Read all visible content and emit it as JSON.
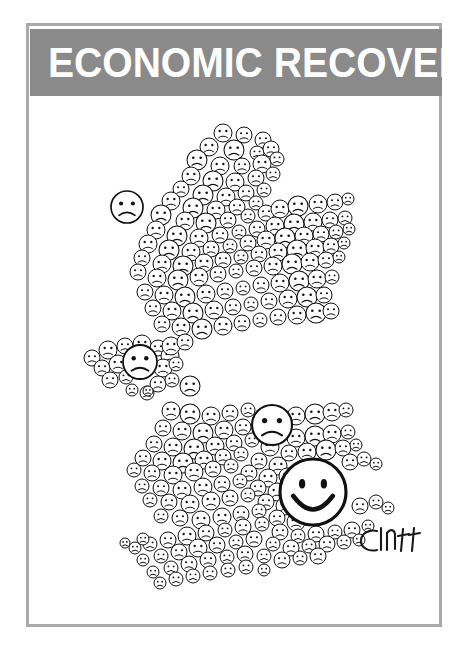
{
  "banner": {
    "title": "ECONOMIC RECOVERY",
    "background_color": "#8a8a8a",
    "text_color": "#ffffff"
  },
  "frame": {
    "border_color": "#a9a9a9",
    "background_color": "#ffffff"
  },
  "signature": {
    "text": "Cluff",
    "ink_color": "#1a1a1a"
  },
  "artwork": {
    "type": "editorial-cartoon",
    "subject": "map-of-united-kingdom-made-of-emoticon-faces",
    "line_color": "#111111",
    "fill_color": "#ffffff",
    "description": "Outline map of the United Kingdom and Ireland built entirely from small circular cartoon faces. Almost every face is frowning; one large smiling face sits over the south-east of England.",
    "happy_face_count": 1,
    "sad_face_count": 236,
    "emphasis_faces": [
      {
        "name": "large-smiley-face",
        "mood": "happy",
        "region": "south-east-england",
        "cx": 283,
        "cy": 396,
        "r": 33
      },
      {
        "name": "large-sad-face",
        "mood": "sad",
        "region": "midlands",
        "cx": 242,
        "cy": 329,
        "r": 20
      },
      {
        "name": "large-sad-face-northern-ireland",
        "mood": "sad",
        "region": "northern-ireland",
        "cx": 110,
        "cy": 266,
        "r": 17
      },
      {
        "name": "isolated-sad-face-hebrides",
        "mood": "sad",
        "region": "outer-hebrides",
        "cx": 97,
        "cy": 111,
        "r": 16
      }
    ],
    "faces": [
      [
        193,
        37,
        9
      ],
      [
        214,
        39,
        8
      ],
      [
        233,
        44,
        8
      ],
      [
        179,
        51,
        9
      ],
      [
        204,
        54,
        10
      ],
      [
        227,
        57,
        7
      ],
      [
        241,
        53,
        8
      ],
      [
        167,
        64,
        10
      ],
      [
        190,
        70,
        9
      ],
      [
        212,
        70,
        8
      ],
      [
        232,
        68,
        9
      ],
      [
        247,
        63,
        7
      ],
      [
        161,
        80,
        9
      ],
      [
        183,
        85,
        10
      ],
      [
        205,
        86,
        9
      ],
      [
        226,
        82,
        8
      ],
      [
        243,
        78,
        7
      ],
      [
        151,
        93,
        8
      ],
      [
        173,
        99,
        10
      ],
      [
        196,
        101,
        9
      ],
      [
        216,
        97,
        8
      ],
      [
        234,
        94,
        7
      ],
      [
        141,
        105,
        9
      ],
      [
        163,
        112,
        10
      ],
      [
        186,
        114,
        9
      ],
      [
        207,
        111,
        8
      ],
      [
        226,
        107,
        7
      ],
      [
        131,
        119,
        10
      ],
      [
        155,
        125,
        9
      ],
      [
        176,
        127,
        10
      ],
      [
        198,
        124,
        8
      ],
      [
        218,
        120,
        7
      ],
      [
        236,
        117,
        8
      ],
      [
        250,
        113,
        9
      ],
      [
        268,
        110,
        10
      ],
      [
        288,
        108,
        9
      ],
      [
        305,
        106,
        8
      ],
      [
        318,
        103,
        6
      ],
      [
        97,
        111,
        16
      ],
      [
        126,
        134,
        9
      ],
      [
        147,
        140,
        10
      ],
      [
        169,
        142,
        9
      ],
      [
        190,
        139,
        8
      ],
      [
        209,
        136,
        7
      ],
      [
        227,
        133,
        8
      ],
      [
        245,
        130,
        9
      ],
      [
        264,
        128,
        10
      ],
      [
        283,
        126,
        9
      ],
      [
        300,
        124,
        8
      ],
      [
        315,
        122,
        7
      ],
      [
        118,
        148,
        9
      ],
      [
        139,
        154,
        10
      ],
      [
        161,
        156,
        9
      ],
      [
        181,
        153,
        8
      ],
      [
        200,
        150,
        7
      ],
      [
        218,
        147,
        8
      ],
      [
        236,
        144,
        9
      ],
      [
        255,
        142,
        10
      ],
      [
        274,
        140,
        9
      ],
      [
        291,
        138,
        8
      ],
      [
        306,
        136,
        7
      ],
      [
        319,
        133,
        6
      ],
      [
        112,
        162,
        8
      ],
      [
        132,
        168,
        9
      ],
      [
        153,
        170,
        10
      ],
      [
        174,
        167,
        9
      ],
      [
        193,
        164,
        8
      ],
      [
        211,
        161,
        7
      ],
      [
        229,
        158,
        8
      ],
      [
        248,
        156,
        9
      ],
      [
        267,
        154,
        10
      ],
      [
        285,
        152,
        9
      ],
      [
        301,
        150,
        8
      ],
      [
        314,
        147,
        6
      ],
      [
        108,
        176,
        8
      ],
      [
        127,
        182,
        9
      ],
      [
        148,
        184,
        10
      ],
      [
        169,
        181,
        9
      ],
      [
        188,
        178,
        8
      ],
      [
        206,
        175,
        7
      ],
      [
        224,
        172,
        8
      ],
      [
        243,
        170,
        9
      ],
      [
        262,
        168,
        10
      ],
      [
        280,
        166,
        9
      ],
      [
        296,
        164,
        8
      ],
      [
        309,
        161,
        6
      ],
      [
        115,
        196,
        8
      ],
      [
        134,
        199,
        9
      ],
      [
        155,
        201,
        10
      ],
      [
        176,
        198,
        9
      ],
      [
        195,
        195,
        8
      ],
      [
        213,
        192,
        7
      ],
      [
        231,
        189,
        8
      ],
      [
        250,
        187,
        9
      ],
      [
        269,
        185,
        10
      ],
      [
        287,
        183,
        9
      ],
      [
        302,
        181,
        7
      ],
      [
        123,
        212,
        8
      ],
      [
        142,
        215,
        9
      ],
      [
        163,
        217,
        10
      ],
      [
        184,
        214,
        9
      ],
      [
        203,
        211,
        8
      ],
      [
        221,
        208,
        7
      ],
      [
        239,
        205,
        8
      ],
      [
        258,
        203,
        9
      ],
      [
        277,
        201,
        10
      ],
      [
        294,
        199,
        8
      ],
      [
        132,
        228,
        8
      ],
      [
        151,
        231,
        9
      ],
      [
        172,
        233,
        10
      ],
      [
        193,
        230,
        9
      ],
      [
        212,
        227,
        8
      ],
      [
        230,
        224,
        7
      ],
      [
        248,
        221,
        8
      ],
      [
        267,
        219,
        9
      ],
      [
        286,
        217,
        10
      ],
      [
        301,
        215,
        8
      ],
      [
        62,
        262,
        8
      ],
      [
        78,
        254,
        9
      ],
      [
        95,
        250,
        8
      ],
      [
        112,
        248,
        9
      ],
      [
        128,
        252,
        8
      ],
      [
        140,
        260,
        9
      ],
      [
        72,
        272,
        8
      ],
      [
        88,
        268,
        9
      ],
      [
        110,
        266,
        17
      ],
      [
        133,
        272,
        9
      ],
      [
        146,
        268,
        7
      ],
      [
        80,
        284,
        8
      ],
      [
        96,
        281,
        7
      ],
      [
        128,
        288,
        8
      ],
      [
        142,
        284,
        7
      ],
      [
        102,
        294,
        6
      ],
      [
        117,
        297,
        7
      ],
      [
        141,
        250,
        9
      ],
      [
        155,
        246,
        8
      ],
      [
        118,
        295,
        5
      ],
      [
        160,
        290,
        10
      ],
      [
        141,
        315,
        9
      ],
      [
        160,
        318,
        10
      ],
      [
        181,
        320,
        9
      ],
      [
        200,
        317,
        8
      ],
      [
        218,
        314,
        7
      ],
      [
        242,
        329,
        20
      ],
      [
        266,
        320,
        9
      ],
      [
        285,
        318,
        10
      ],
      [
        302,
        316,
        9
      ],
      [
        316,
        314,
        7
      ],
      [
        133,
        332,
        8
      ],
      [
        152,
        335,
        9
      ],
      [
        173,
        337,
        10
      ],
      [
        194,
        334,
        9
      ],
      [
        213,
        331,
        8
      ],
      [
        266,
        342,
        9
      ],
      [
        285,
        340,
        10
      ],
      [
        302,
        338,
        9
      ],
      [
        318,
        336,
        7
      ],
      [
        124,
        348,
        8
      ],
      [
        143,
        351,
        9
      ],
      [
        164,
        353,
        10
      ],
      [
        185,
        350,
        9
      ],
      [
        204,
        347,
        8
      ],
      [
        222,
        344,
        7
      ],
      [
        240,
        351,
        9
      ],
      [
        259,
        357,
        8
      ],
      [
        277,
        356,
        9
      ],
      [
        296,
        354,
        10
      ],
      [
        313,
        352,
        8
      ],
      [
        326,
        349,
        6
      ],
      [
        113,
        362,
        8
      ],
      [
        132,
        365,
        9
      ],
      [
        153,
        367,
        10
      ],
      [
        174,
        364,
        9
      ],
      [
        193,
        361,
        8
      ],
      [
        211,
        358,
        7
      ],
      [
        229,
        365,
        8
      ],
      [
        248,
        370,
        9
      ],
      [
        320,
        366,
        8
      ],
      [
        334,
        363,
        7
      ],
      [
        346,
        368,
        6
      ],
      [
        104,
        374,
        7
      ],
      [
        122,
        377,
        8
      ],
      [
        143,
        379,
        9
      ],
      [
        164,
        376,
        9
      ],
      [
        183,
        373,
        8
      ],
      [
        201,
        370,
        7
      ],
      [
        219,
        377,
        8
      ],
      [
        238,
        382,
        9
      ],
      [
        257,
        380,
        8
      ],
      [
        112,
        390,
        7
      ],
      [
        131,
        392,
        8
      ],
      [
        152,
        394,
        9
      ],
      [
        173,
        391,
        9
      ],
      [
        192,
        388,
        8
      ],
      [
        210,
        385,
        7
      ],
      [
        228,
        392,
        8
      ],
      [
        247,
        396,
        9
      ],
      [
        265,
        394,
        8
      ],
      [
        120,
        404,
        7
      ],
      [
        139,
        406,
        8
      ],
      [
        160,
        408,
        9
      ],
      [
        181,
        405,
        9
      ],
      [
        200,
        402,
        8
      ],
      [
        218,
        399,
        7
      ],
      [
        236,
        406,
        8
      ],
      [
        255,
        410,
        9
      ],
      [
        274,
        408,
        8
      ],
      [
        283,
        396,
        33
      ],
      [
        131,
        420,
        7
      ],
      [
        150,
        422,
        8
      ],
      [
        171,
        424,
        9
      ],
      [
        192,
        421,
        9
      ],
      [
        211,
        418,
        8
      ],
      [
        229,
        415,
        7
      ],
      [
        247,
        422,
        8
      ],
      [
        266,
        426,
        9
      ],
      [
        330,
        410,
        8
      ],
      [
        346,
        406,
        7
      ],
      [
        358,
        412,
        6
      ],
      [
        105,
        452,
        6
      ],
      [
        120,
        448,
        7
      ],
      [
        138,
        444,
        8
      ],
      [
        157,
        440,
        9
      ],
      [
        176,
        437,
        8
      ],
      [
        195,
        434,
        7
      ],
      [
        213,
        431,
        8
      ],
      [
        232,
        428,
        7
      ],
      [
        250,
        436,
        8
      ],
      [
        268,
        440,
        7
      ],
      [
        286,
        438,
        8
      ],
      [
        305,
        436,
        7
      ],
      [
        322,
        434,
        8
      ],
      [
        338,
        430,
        6
      ],
      [
        113,
        464,
        6
      ],
      [
        131,
        460,
        7
      ],
      [
        149,
        456,
        8
      ],
      [
        168,
        452,
        9
      ],
      [
        187,
        449,
        8
      ],
      [
        206,
        446,
        7
      ],
      [
        224,
        443,
        8
      ],
      [
        243,
        448,
        7
      ],
      [
        261,
        452,
        8
      ],
      [
        279,
        450,
        7
      ],
      [
        297,
        448,
        8
      ],
      [
        314,
        446,
        7
      ],
      [
        329,
        444,
        6
      ],
      [
        123,
        476,
        6
      ],
      [
        141,
        472,
        7
      ],
      [
        159,
        468,
        8
      ],
      [
        178,
        464,
        8
      ],
      [
        197,
        461,
        7
      ],
      [
        215,
        458,
        8
      ],
      [
        234,
        460,
        7
      ],
      [
        252,
        464,
        8
      ],
      [
        270,
        462,
        7
      ],
      [
        288,
        460,
        8
      ],
      [
        130,
        487,
        6
      ],
      [
        146,
        483,
        7
      ],
      [
        163,
        480,
        7
      ],
      [
        180,
        477,
        7
      ],
      [
        198,
        474,
        7
      ],
      [
        216,
        471,
        7
      ],
      [
        234,
        474,
        6
      ],
      [
        113,
        443,
        6
      ],
      [
        95,
        447,
        5
      ]
    ]
  }
}
